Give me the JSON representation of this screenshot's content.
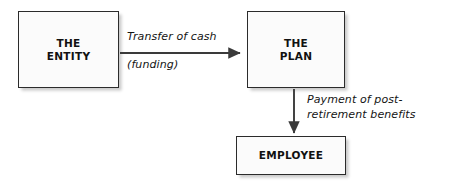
{
  "diagram": {
    "nodes": [
      {
        "id": "entity",
        "label": "THE\nENTITY"
      },
      {
        "id": "plan",
        "label": "THE\nPLAN"
      },
      {
        "id": "employee",
        "label": "EMPLOYEE"
      }
    ],
    "edges": [
      {
        "id": "entity-to-plan",
        "from": "THE ENTITY",
        "to": "THE PLAN",
        "direction": "right",
        "label_above": "Transfer of cash",
        "label_below": "(funding)"
      },
      {
        "id": "plan-to-employee",
        "from": "THE PLAN",
        "to": "EMPLOYEE",
        "direction": "down",
        "label": "Payment of post-\nretirement benefits"
      }
    ],
    "colors": {
      "box_fill": "#fbfbfb",
      "box_border": "#2b2b2b",
      "arrow": "#3a3a3a",
      "text": "#111111",
      "background": "#ffffff"
    }
  }
}
